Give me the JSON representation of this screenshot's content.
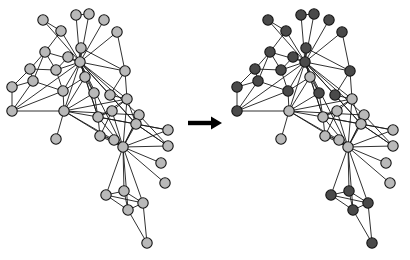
{
  "figure": {
    "background_color": "#ffffff"
  },
  "colors": {
    "node_light": "#b9b9b9",
    "node_dark": "#4a4a4a",
    "node_outline": "#141414",
    "edge": "#1a1a1a",
    "arrow": "#000000"
  },
  "arrow": {
    "name": "transform-arrow",
    "glyph": "→",
    "x1": 188,
    "y1": 123,
    "x2": 222,
    "y2": 123
  },
  "graph": {
    "node_radius": 5.2,
    "node_count": 39,
    "edge_count": 93,
    "nodes": [
      {
        "id": 0,
        "x": 43,
        "y": 20,
        "community": "dark"
      },
      {
        "id": 1,
        "x": 61,
        "y": 31,
        "community": "dark"
      },
      {
        "id": 2,
        "x": 76,
        "y": 15,
        "community": "dark"
      },
      {
        "id": 3,
        "x": 89,
        "y": 14,
        "community": "dark"
      },
      {
        "id": 4,
        "x": 104,
        "y": 20,
        "community": "dark"
      },
      {
        "id": 5,
        "x": 117,
        "y": 32,
        "community": "dark"
      },
      {
        "id": 6,
        "x": 45,
        "y": 52,
        "community": "dark"
      },
      {
        "id": 7,
        "x": 81,
        "y": 48,
        "community": "dark"
      },
      {
        "id": 8,
        "x": 80,
        "y": 62,
        "community": "dark"
      },
      {
        "id": 9,
        "x": 56,
        "y": 70,
        "community": "dark"
      },
      {
        "id": 10,
        "x": 33,
        "y": 81,
        "community": "dark"
      },
      {
        "id": 11,
        "x": 12,
        "y": 87,
        "community": "dark"
      },
      {
        "id": 12,
        "x": 12,
        "y": 111,
        "community": "dark"
      },
      {
        "id": 13,
        "x": 63,
        "y": 91,
        "community": "dark"
      },
      {
        "id": 14,
        "x": 64,
        "y": 111,
        "community": "light"
      },
      {
        "id": 15,
        "x": 56,
        "y": 139,
        "community": "light"
      },
      {
        "id": 16,
        "x": 98,
        "y": 117,
        "community": "light"
      },
      {
        "id": 17,
        "x": 125,
        "y": 71,
        "community": "dark"
      },
      {
        "id": 18,
        "x": 110,
        "y": 95,
        "community": "dark"
      },
      {
        "id": 19,
        "x": 112,
        "y": 111,
        "community": "light"
      },
      {
        "id": 20,
        "x": 127,
        "y": 99,
        "community": "light"
      },
      {
        "id": 21,
        "x": 139,
        "y": 115,
        "community": "light"
      },
      {
        "id": 22,
        "x": 136,
        "y": 124,
        "community": "light"
      },
      {
        "id": 23,
        "x": 114,
        "y": 140,
        "community": "light"
      },
      {
        "id": 24,
        "x": 123,
        "y": 147,
        "community": "light"
      },
      {
        "id": 25,
        "x": 168,
        "y": 130,
        "community": "light"
      },
      {
        "id": 26,
        "x": 168,
        "y": 146,
        "community": "light"
      },
      {
        "id": 27,
        "x": 161,
        "y": 163,
        "community": "light"
      },
      {
        "id": 28,
        "x": 165,
        "y": 183,
        "community": "light"
      },
      {
        "id": 29,
        "x": 106,
        "y": 195,
        "community": "dark"
      },
      {
        "id": 30,
        "x": 124,
        "y": 191,
        "community": "dark"
      },
      {
        "id": 31,
        "x": 128,
        "y": 210,
        "community": "dark"
      },
      {
        "id": 32,
        "x": 143,
        "y": 203,
        "community": "dark"
      },
      {
        "id": 33,
        "x": 147,
        "y": 243,
        "community": "dark"
      },
      {
        "id": 34,
        "x": 30,
        "y": 69,
        "community": "dark"
      },
      {
        "id": 35,
        "x": 68,
        "y": 57,
        "community": "dark"
      },
      {
        "id": 36,
        "x": 94,
        "y": 93,
        "community": "dark"
      },
      {
        "id": 37,
        "x": 85,
        "y": 77,
        "community": "light"
      },
      {
        "id": 38,
        "x": 100,
        "y": 136,
        "community": "light"
      }
    ],
    "edges": [
      [
        0,
        1
      ],
      [
        0,
        8
      ],
      [
        1,
        8
      ],
      [
        2,
        8
      ],
      [
        3,
        8
      ],
      [
        4,
        8
      ],
      [
        5,
        8
      ],
      [
        5,
        17
      ],
      [
        2,
        3
      ],
      [
        6,
        8
      ],
      [
        6,
        34
      ],
      [
        6,
        9
      ],
      [
        6,
        10
      ],
      [
        6,
        1
      ],
      [
        34,
        11
      ],
      [
        34,
        10
      ],
      [
        34,
        9
      ],
      [
        10,
        11
      ],
      [
        10,
        12
      ],
      [
        10,
        13
      ],
      [
        11,
        12
      ],
      [
        12,
        14
      ],
      [
        12,
        13
      ],
      [
        9,
        8
      ],
      [
        9,
        13
      ],
      [
        9,
        35
      ],
      [
        35,
        8
      ],
      [
        7,
        8
      ],
      [
        7,
        17
      ],
      [
        13,
        8
      ],
      [
        13,
        14
      ],
      [
        13,
        37
      ],
      [
        14,
        8
      ],
      [
        14,
        37
      ],
      [
        14,
        16
      ],
      [
        14,
        15
      ],
      [
        14,
        36
      ],
      [
        14,
        20
      ],
      [
        14,
        21
      ],
      [
        14,
        23
      ],
      [
        14,
        24
      ],
      [
        37,
        8
      ],
      [
        37,
        36
      ],
      [
        36,
        8
      ],
      [
        36,
        16
      ],
      [
        16,
        8
      ],
      [
        16,
        20
      ],
      [
        16,
        22
      ],
      [
        16,
        24
      ],
      [
        16,
        25
      ],
      [
        16,
        38
      ],
      [
        16,
        19
      ],
      [
        17,
        8
      ],
      [
        17,
        18
      ],
      [
        17,
        20
      ],
      [
        18,
        8
      ],
      [
        18,
        20
      ],
      [
        18,
        22
      ],
      [
        19,
        20
      ],
      [
        19,
        24
      ],
      [
        19,
        38
      ],
      [
        20,
        22
      ],
      [
        20,
        24
      ],
      [
        21,
        22
      ],
      [
        21,
        24
      ],
      [
        22,
        24
      ],
      [
        22,
        26
      ],
      [
        23,
        24
      ],
      [
        23,
        38
      ],
      [
        38,
        24
      ],
      [
        24,
        25
      ],
      [
        24,
        26
      ],
      [
        24,
        27
      ],
      [
        24,
        28
      ],
      [
        24,
        21
      ],
      [
        24,
        8
      ],
      [
        24,
        29
      ],
      [
        24,
        30
      ],
      [
        24,
        31
      ],
      [
        24,
        32
      ],
      [
        25,
        22
      ],
      [
        26,
        22
      ],
      [
        21,
        26
      ],
      [
        29,
        30
      ],
      [
        29,
        31
      ],
      [
        30,
        31
      ],
      [
        30,
        32
      ],
      [
        31,
        32
      ],
      [
        31,
        33
      ],
      [
        32,
        33
      ],
      [
        29,
        32
      ],
      [
        8,
        20
      ],
      [
        8,
        22
      ],
      [
        8,
        16
      ],
      [
        8,
        12
      ],
      [
        8,
        21
      ]
    ]
  },
  "panels": [
    {
      "name": "left-graph",
      "label": "input-graph-uncolored",
      "offset_x": 0,
      "offset_y": 0,
      "uniform_color": "#b9b9b9",
      "colored_by_community": false
    },
    {
      "name": "right-graph",
      "label": "output-graph-communities",
      "offset_x": 225,
      "offset_y": 0,
      "uniform_color": null,
      "colored_by_community": true
    }
  ]
}
